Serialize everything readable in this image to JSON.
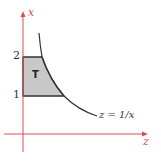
{
  "diagram": {
    "axes": {
      "vertical_label": "x",
      "horizontal_label": "z",
      "color": "#e04a55"
    },
    "ticks": [
      {
        "label": "2",
        "value": 2
      },
      {
        "label": "1",
        "value": 1
      }
    ],
    "region": {
      "label": "T",
      "fill": "#c8c8c8",
      "description": "region bounded by x=1, x=2, z=0 and z=1/x"
    },
    "curve": {
      "label": "z = 1/x"
    }
  }
}
